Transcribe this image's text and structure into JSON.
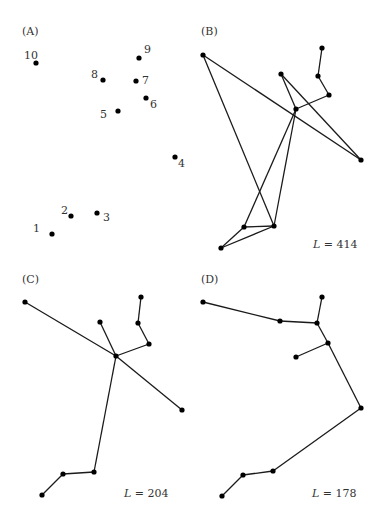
{
  "figure": {
    "panels": [
      {
        "id": "A",
        "label": "(A)",
        "label_pos": [
          22,
          35
        ],
        "length_label": null,
        "nodes": [
          {
            "n": 1,
            "x": 52,
            "y": 234,
            "tx": 33,
            "ty": 232,
            "text": "1"
          },
          {
            "n": 2,
            "x": 71,
            "y": 216,
            "tx": 61,
            "ty": 214,
            "text": "2"
          },
          {
            "n": 3,
            "x": 97,
            "y": 213,
            "tx": 103,
            "ty": 221,
            "text": "3"
          },
          {
            "n": 4,
            "x": 175,
            "y": 157,
            "tx": 178,
            "ty": 167,
            "text": "4"
          },
          {
            "n": 5,
            "x": 118,
            "y": 111,
            "tx": 100,
            "ty": 118,
            "text": "5"
          },
          {
            "n": 6,
            "x": 146,
            "y": 98,
            "tx": 150,
            "ty": 108,
            "text": "6"
          },
          {
            "n": 7,
            "x": 136,
            "y": 81,
            "tx": 142,
            "ty": 84,
            "text": "7"
          },
          {
            "n": 8,
            "x": 103,
            "y": 80,
            "tx": 91,
            "ty": 78,
            "text": "8"
          },
          {
            "n": 9,
            "x": 139,
            "y": 58,
            "tx": 144,
            "ty": 53,
            "text": "9"
          },
          {
            "n": 10,
            "x": 36,
            "y": 63,
            "tx": 24,
            "ty": 59,
            "text": "10"
          }
        ],
        "edges": []
      },
      {
        "id": "B",
        "label": "(B)",
        "label_pos": [
          201,
          35
        ],
        "length_label": {
          "prefix": "L",
          "text": " = 414",
          "x": 313,
          "y": 248
        },
        "nodes": [
          {
            "n": 1,
            "x": 221,
            "y": 248
          },
          {
            "n": 2,
            "x": 244,
            "y": 227
          },
          {
            "n": 3,
            "x": 274,
            "y": 226
          },
          {
            "n": 4,
            "x": 361,
            "y": 160
          },
          {
            "n": 5,
            "x": 296,
            "y": 109
          },
          {
            "n": 6,
            "x": 329,
            "y": 95
          },
          {
            "n": 7,
            "x": 318,
            "y": 76
          },
          {
            "n": 8,
            "x": 281,
            "y": 74
          },
          {
            "n": 9,
            "x": 322,
            "y": 48
          },
          {
            "n": 10,
            "x": 203,
            "y": 55
          }
        ],
        "edges": [
          [
            1,
            2
          ],
          [
            1,
            3
          ],
          [
            2,
            3
          ],
          [
            2,
            5
          ],
          [
            3,
            5
          ],
          [
            3,
            10
          ],
          [
            10,
            4
          ],
          [
            4,
            8
          ],
          [
            8,
            5
          ],
          [
            5,
            6
          ],
          [
            6,
            7
          ],
          [
            7,
            9
          ]
        ]
      },
      {
        "id": "C",
        "label": "(C)",
        "label_pos": [
          22,
          283
        ],
        "length_label": {
          "prefix": "L",
          "text": " = 204",
          "x": 124,
          "y": 497
        },
        "nodes": [
          {
            "n": 1,
            "x": 42,
            "y": 495
          },
          {
            "n": 2,
            "x": 63,
            "y": 474
          },
          {
            "n": 3,
            "x": 94,
            "y": 472
          },
          {
            "n": 4,
            "x": 182,
            "y": 410
          },
          {
            "n": 5,
            "x": 116,
            "y": 356
          },
          {
            "n": 6,
            "x": 149,
            "y": 344
          },
          {
            "n": 7,
            "x": 138,
            "y": 323
          },
          {
            "n": 8,
            "x": 100,
            "y": 322
          },
          {
            "n": 9,
            "x": 141,
            "y": 297
          },
          {
            "n": 10,
            "x": 25,
            "y": 302
          }
        ],
        "edges": [
          [
            1,
            2
          ],
          [
            2,
            3
          ],
          [
            3,
            5
          ],
          [
            5,
            4
          ],
          [
            5,
            10
          ],
          [
            5,
            8
          ],
          [
            5,
            6
          ],
          [
            6,
            7
          ],
          [
            7,
            9
          ]
        ]
      },
      {
        "id": "D",
        "label": "(D)",
        "label_pos": [
          201,
          283
        ],
        "length_label": {
          "prefix": "L",
          "text": " = 178",
          "x": 312,
          "y": 497
        },
        "nodes": [
          {
            "n": 1,
            "x": 222,
            "y": 496
          },
          {
            "n": 2,
            "x": 243,
            "y": 475
          },
          {
            "n": 3,
            "x": 273,
            "y": 471
          },
          {
            "n": 4,
            "x": 361,
            "y": 408
          },
          {
            "n": 5,
            "x": 296,
            "y": 357
          },
          {
            "n": 6,
            "x": 328,
            "y": 343
          },
          {
            "n": 7,
            "x": 317,
            "y": 323
          },
          {
            "n": 8,
            "x": 280,
            "y": 321
          },
          {
            "n": 9,
            "x": 322,
            "y": 297
          },
          {
            "n": 10,
            "x": 203,
            "y": 302
          }
        ],
        "edges": [
          [
            1,
            2
          ],
          [
            2,
            3
          ],
          [
            3,
            4
          ],
          [
            4,
            6
          ],
          [
            6,
            5
          ],
          [
            6,
            7
          ],
          [
            7,
            9
          ],
          [
            7,
            8
          ],
          [
            8,
            10
          ]
        ]
      }
    ]
  }
}
